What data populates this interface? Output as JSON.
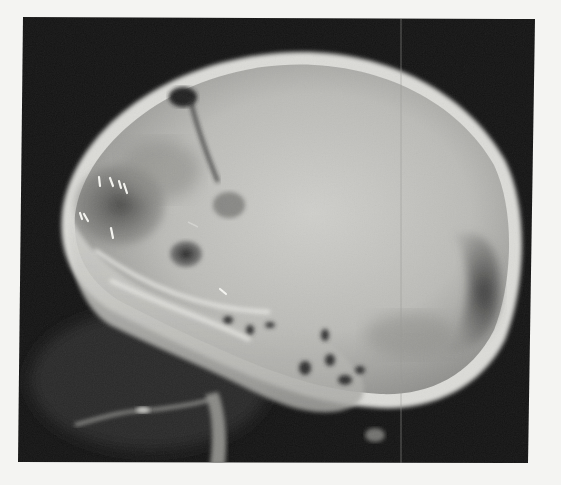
{
  "image": {
    "description": "Lateral skull radiograph (X-ray film) showing an enlarged, rounded cranial vault with small bright metallic marker artifacts in the orbital region, a dark linear track in the frontal region, and dense skull base structures.",
    "view": "lateral",
    "subject": "skull"
  },
  "regions": [
    {
      "name": "cranial-vault",
      "label": "Cranial vault"
    },
    {
      "name": "frontal-dark-pocket",
      "label": "Frontal dark pocket"
    },
    {
      "name": "linear-track",
      "label": "Dark linear track"
    },
    {
      "name": "round-lucency-upper",
      "label": "Rounded lucency (upper)"
    },
    {
      "name": "round-lucency-lower",
      "label": "Rounded lucency (lower)"
    },
    {
      "name": "orbit-region",
      "label": "Orbital region"
    },
    {
      "name": "occipital-thinning",
      "label": "Occipital dark crescent"
    },
    {
      "name": "skull-base",
      "label": "Skull base"
    },
    {
      "name": "cervical-spine",
      "label": "Cervical structures"
    },
    {
      "name": "mandible-line",
      "label": "Mandible outline"
    }
  ],
  "markers": {
    "count": 8,
    "type": "bright metallic clips"
  },
  "artifacts": {
    "vertical_scratch": "thin vertical film scratch"
  },
  "colors": {
    "page_background": "#f4f4f2",
    "film_background": "#141414",
    "bone_bright": "#e8e8e4",
    "vault_fill": "#bdbdba",
    "dark_lucency": "#2c2c2c"
  }
}
